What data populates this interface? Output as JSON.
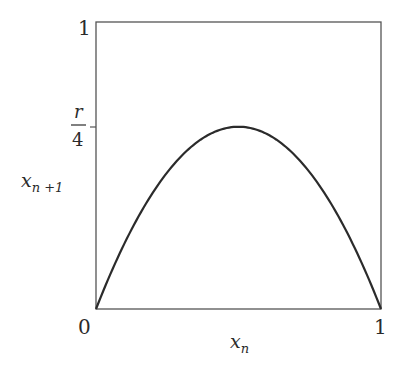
{
  "chart_data": {
    "type": "line",
    "title": "",
    "function": "x_{n+1} = r x_n (1 - x_n)",
    "xlabel": "x_n",
    "ylabel": "x_{n+1}",
    "xlim": [
      0,
      1
    ],
    "ylim": [
      0,
      1
    ],
    "x_ticks": [
      {
        "value": 0,
        "label": "0"
      },
      {
        "value": 1,
        "label": "1"
      }
    ],
    "y_ticks": [
      {
        "value": 1,
        "label": "1"
      },
      {
        "value": 0.634,
        "label": "r/4"
      }
    ],
    "r": 2.54,
    "peak": {
      "x": 0.5,
      "y": 0.634,
      "label": "r/4"
    },
    "grid": false,
    "legend": null,
    "series": [
      {
        "name": "logistic map",
        "x": [
          0,
          0.05,
          0.1,
          0.15,
          0.2,
          0.25,
          0.3,
          0.35,
          0.4,
          0.45,
          0.5,
          0.55,
          0.6,
          0.65,
          0.7,
          0.75,
          0.8,
          0.85,
          0.9,
          0.95,
          1
        ],
        "y": [
          0,
          0.121,
          0.229,
          0.324,
          0.406,
          0.476,
          0.533,
          0.578,
          0.61,
          0.629,
          0.635,
          0.629,
          0.61,
          0.578,
          0.533,
          0.476,
          0.406,
          0.324,
          0.229,
          0.121,
          0
        ]
      }
    ]
  },
  "labels": {
    "y_top": "1",
    "y_mid_num": "r",
    "y_mid_den": "4",
    "origin": "0",
    "x_right": "1",
    "ylabel_main": "x",
    "ylabel_sub": "n +1",
    "xlabel_main": "x",
    "xlabel_sub": "n"
  },
  "style": {
    "line_color": "#2b2b2b",
    "frame_color": "#555555",
    "text_color": "#2a2a2a"
  }
}
